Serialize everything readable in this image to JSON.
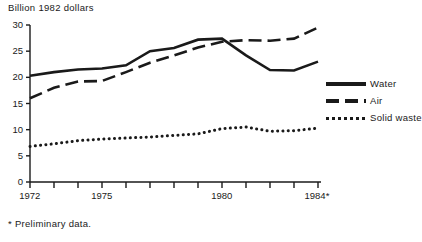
{
  "axis_title": "Billion  1982 dollars",
  "footnote": "* Preliminary data.",
  "legend": {
    "entries": [
      {
        "label": "Water",
        "style": "solid"
      },
      {
        "label": "Air",
        "style": "dashed"
      },
      {
        "label": "Solid waste",
        "style": "dotted"
      }
    ]
  },
  "ticks": {
    "y": [
      "30",
      "25",
      "20",
      "15",
      "10",
      "5",
      "0"
    ],
    "x_labeled": [
      "1972",
      "1975",
      "1980",
      "1984*"
    ]
  },
  "chart_data": {
    "type": "line",
    "title": "Billion  1982 dollars",
    "xlabel": "",
    "ylabel": "Billion 1982 dollars",
    "xlim": [
      1972,
      1984
    ],
    "ylim": [
      0,
      30
    ],
    "grid": false,
    "legend_position": "right",
    "annotations": [
      "* Preliminary data."
    ],
    "x": [
      1972,
      1973,
      1974,
      1975,
      1976,
      1977,
      1978,
      1979,
      1980,
      1981,
      1982,
      1983,
      1984
    ],
    "xtick_labels": [
      "1972",
      "",
      "",
      "1975",
      "",
      "",
      "",
      "",
      "1980",
      "",
      "",
      "",
      "1984*"
    ],
    "ytick_labels": [
      "0",
      "5",
      "10",
      "15",
      "20",
      "25",
      "30"
    ],
    "series": [
      {
        "name": "Water",
        "style": "solid",
        "values": [
          20.3,
          21.0,
          21.5,
          21.7,
          22.3,
          25.0,
          25.6,
          27.2,
          27.4,
          24.2,
          21.4,
          21.3,
          23.0
        ]
      },
      {
        "name": "Air",
        "style": "dashed",
        "values": [
          16.0,
          18.0,
          19.2,
          19.3,
          21.0,
          22.8,
          24.2,
          25.7,
          26.8,
          27.1,
          27.0,
          27.4,
          29.5
        ]
      },
      {
        "name": "Solid waste",
        "style": "dotted",
        "values": [
          6.8,
          7.3,
          7.9,
          8.2,
          8.4,
          8.6,
          8.9,
          9.2,
          10.2,
          10.5,
          9.7,
          9.8,
          10.3
        ]
      }
    ]
  }
}
